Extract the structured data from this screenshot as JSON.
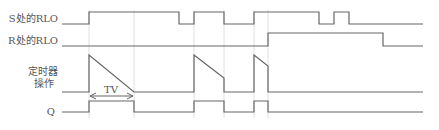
{
  "labels": {
    "s_rlo": "S处的RLO",
    "r_rlo": "R处的RLO",
    "timer_line1": "定时器",
    "timer_line2": "操作",
    "q": "Q",
    "tv": "TV"
  },
  "colors": {
    "signal": "#666666",
    "guide": "#d8d8d8",
    "text": "#555555"
  },
  "signals": {
    "s_rlo": {
      "low_y": 24,
      "high_y": 12,
      "start_x": 62,
      "end_x": 423,
      "transitions": [
        89,
        179,
        194,
        224,
        254,
        319,
        334,
        349
      ],
      "initial": "low"
    },
    "r_rlo": {
      "low_y": 46,
      "high_y": 33,
      "start_x": 62,
      "end_x": 423,
      "transitions": [
        268,
        383
      ],
      "initial": "low"
    },
    "timer": {
      "base_y": 92,
      "top_y": 55,
      "start_x": 62,
      "end_x": 423,
      "ramps": [
        {
          "start_x": 89,
          "end_x": 134,
          "end_y": 92
        },
        {
          "start_x": 194,
          "end_x": 224,
          "end_y": 78
        },
        {
          "start_x": 254,
          "end_x": 268,
          "end_y": 66
        }
      ]
    },
    "q": {
      "low_y": 112,
      "high_y": 101,
      "start_x": 62,
      "end_x": 423,
      "transitions": [
        89,
        134,
        194,
        224,
        254,
        268
      ],
      "initial": "low"
    }
  },
  "tv_arrow": {
    "x1": 89,
    "x2": 134,
    "y": 96
  },
  "guides": [
    89,
    134,
    194,
    224,
    254,
    268
  ]
}
